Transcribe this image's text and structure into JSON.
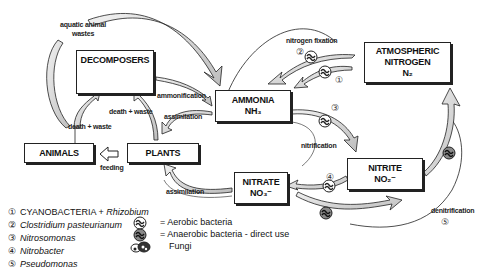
{
  "diagram": {
    "nodes": {
      "decomposers": {
        "title": "DECOMPOSERS"
      },
      "ammonia": {
        "title": "AMMONIA",
        "formula": "NH₃"
      },
      "atmospheric": {
        "title_line1": "ATMOSPHERIC",
        "title_line2": "NITROGEN",
        "formula": "N₂"
      },
      "animals": {
        "title": "ANIMALS"
      },
      "plants": {
        "title": "PLANTS"
      },
      "nitrate": {
        "title": "NITRATE",
        "formula": "NO₃⁻"
      },
      "nitrite": {
        "title": "NITRITE",
        "formula": "NO₂⁻"
      }
    },
    "edge_labels": {
      "aquatic_line1": "aquatic animal",
      "aquatic_line2": "wastes",
      "nitrogen_fixation": "nitrogen fixation",
      "ammonification": "ammonification",
      "assimilation_top": "assimilation",
      "death_waste_left": "death + waste",
      "death_waste_mid": "death + waste",
      "feeding": "feeding",
      "nitrification": "nitrification",
      "assimilation_bottom": "assimilation",
      "denitrification": "denitrification"
    },
    "step_numbers": {
      "n1": "①",
      "n2": "②",
      "n3": "③",
      "n4": "④",
      "n5": "⑤"
    },
    "legend": [
      {
        "num": "①",
        "text": "CYANOBACTERIA + ",
        "italic": "Rhizobium"
      },
      {
        "num": "②",
        "text": "",
        "italic": "Clostridium pasteurianum"
      },
      {
        "num": "③",
        "text": "",
        "italic": "Nitrosomonas"
      },
      {
        "num": "④",
        "text": "",
        "italic": "Nitrobacter"
      },
      {
        "num": "⑤",
        "text": "",
        "italic": "Pseudomonas"
      }
    ],
    "key": [
      {
        "icon": "aerobic-bacteria-icon",
        "text": "= Aerobic bacteria"
      },
      {
        "icon": "anaerobic-bacteria-icon",
        "text": "= Anaerobic bacteria - direct use"
      },
      {
        "icon": "fungi-icon",
        "text": "Fungi"
      }
    ],
    "colors": {
      "arrow_fill": "#d8d8d8",
      "arrow_stroke": "#222222",
      "box_border": "#222222",
      "background": "#ffffff"
    }
  }
}
